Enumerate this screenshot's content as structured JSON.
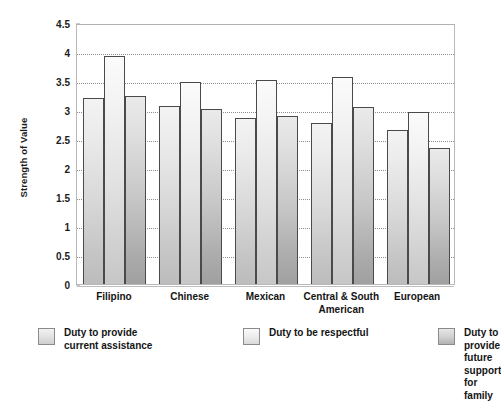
{
  "chart_data": {
    "type": "bar",
    "title": "",
    "xlabel": "",
    "ylabel": "Strength of Value",
    "ylim": [
      0,
      4.5
    ],
    "ytick_labels": [
      "0",
      "0.5",
      "1",
      "1.5",
      "2",
      "2.5",
      "3",
      "3.5",
      "4",
      "4.5"
    ],
    "ytick_values": [
      0,
      0.5,
      1,
      1.5,
      2,
      2.5,
      3,
      3.5,
      4,
      4.5
    ],
    "grid": true,
    "grid_axis": "y",
    "legend_position": "bottom",
    "categories": [
      "Filipino",
      "Chinese",
      "Mexican",
      "Central & South\nAmerican",
      "European"
    ],
    "series": [
      {
        "name": "Duty to provide\ncurrent assistance",
        "color": "#dcdcdc",
        "values": [
          3.2,
          3.07,
          2.87,
          2.77,
          2.65
        ]
      },
      {
        "name": "Duty to be respectful",
        "color": "#ededed",
        "values": [
          3.93,
          3.48,
          3.52,
          3.57,
          2.97
        ]
      },
      {
        "name": "Duty to provide future\nsupport for family",
        "color": "#c4c4c4",
        "values": [
          3.25,
          3.02,
          2.9,
          3.05,
          2.35
        ]
      }
    ]
  }
}
